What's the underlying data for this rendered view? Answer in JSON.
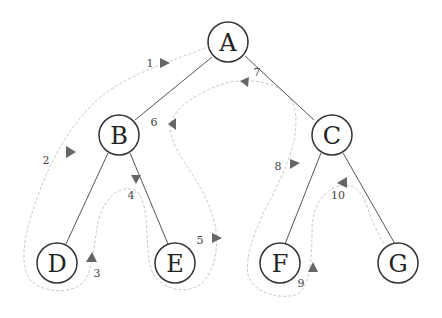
{
  "diagram": {
    "type": "binary-tree-traversal",
    "nodes": [
      {
        "id": "A",
        "label": "A",
        "x": 228,
        "y": 42
      },
      {
        "id": "B",
        "label": "B",
        "x": 119,
        "y": 135
      },
      {
        "id": "C",
        "label": "C",
        "x": 332,
        "y": 135
      },
      {
        "id": "D",
        "label": "D",
        "x": 57,
        "y": 263
      },
      {
        "id": "E",
        "label": "E",
        "x": 175,
        "y": 263
      },
      {
        "id": "F",
        "label": "F",
        "x": 280,
        "y": 263
      },
      {
        "id": "G",
        "label": "G",
        "x": 398,
        "y": 263
      }
    ],
    "edges": [
      {
        "from": "A",
        "to": "B"
      },
      {
        "from": "A",
        "to": "C"
      },
      {
        "from": "B",
        "to": "D"
      },
      {
        "from": "B",
        "to": "E"
      },
      {
        "from": "C",
        "to": "F"
      },
      {
        "from": "C",
        "to": "G"
      }
    ],
    "steps": [
      {
        "label": "1",
        "x": 150,
        "y": 63
      },
      {
        "label": "2",
        "x": 46,
        "y": 160
      },
      {
        "label": "3",
        "x": 97,
        "y": 273
      },
      {
        "label": "4",
        "x": 131,
        "y": 195
      },
      {
        "label": "5",
        "x": 200,
        "y": 240
      },
      {
        "label": "6",
        "x": 154,
        "y": 122
      },
      {
        "label": "7",
        "x": 257,
        "y": 72
      },
      {
        "label": "8",
        "x": 278,
        "y": 166
      },
      {
        "label": "9",
        "x": 301,
        "y": 283
      },
      {
        "label": "10",
        "x": 338,
        "y": 195
      }
    ]
  }
}
